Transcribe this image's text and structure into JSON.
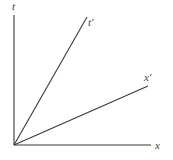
{
  "diagram": {
    "type": "spacetime-diagram",
    "origin": {
      "x": 14,
      "y": 145
    },
    "axes": {
      "t": {
        "label": "t",
        "end": {
          "x": 14,
          "y": 15
        },
        "label_pos": {
          "x": 12,
          "y": 10
        }
      },
      "x": {
        "label": "x",
        "end": {
          "x": 151,
          "y": 145
        },
        "label_pos": {
          "x": 155,
          "y": 149
        }
      }
    },
    "boosted_axes": {
      "t_prime": {
        "label": "t′",
        "end": {
          "x": 87,
          "y": 17
        },
        "label_pos": {
          "x": 88,
          "y": 26
        }
      },
      "x_prime": {
        "label": "x′",
        "end": {
          "x": 148,
          "y": 86
        },
        "label_pos": {
          "x": 144,
          "y": 81
        }
      }
    },
    "colors": {
      "line": "#3a3a3a",
      "text": "#444444",
      "background": "#ffffff"
    }
  }
}
